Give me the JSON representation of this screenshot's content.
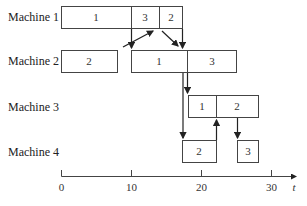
{
  "diagram": {
    "type": "gantt-schedule",
    "axis": {
      "label": "t",
      "ticks": [
        {
          "value": 0,
          "label": "0"
        },
        {
          "value": 10,
          "label": "10"
        },
        {
          "value": 20,
          "label": "20"
        },
        {
          "value": 30,
          "label": "30"
        }
      ]
    },
    "machines": [
      {
        "label": "Machine 1",
        "jobs": [
          {
            "job": "1",
            "start": 0,
            "end": 10
          },
          {
            "job": "3",
            "start": 10,
            "end": 14
          },
          {
            "job": "2",
            "start": 14,
            "end": 17
          }
        ]
      },
      {
        "label": "Machine 2",
        "jobs": [
          {
            "job": "2",
            "start": 0,
            "end": 8
          },
          {
            "job": "1",
            "start": 10,
            "end": 18
          },
          {
            "job": "3",
            "start": 18,
            "end": 25
          }
        ]
      },
      {
        "label": "Machine 3",
        "jobs": [
          {
            "job": "1",
            "start": 18,
            "end": 22
          },
          {
            "job": "2",
            "start": 22,
            "end": 28
          }
        ]
      },
      {
        "label": "Machine 4",
        "jobs": [
          {
            "job": "2",
            "start": 17,
            "end": 22
          },
          {
            "job": "3",
            "start": 25,
            "end": 28
          }
        ]
      }
    ]
  }
}
